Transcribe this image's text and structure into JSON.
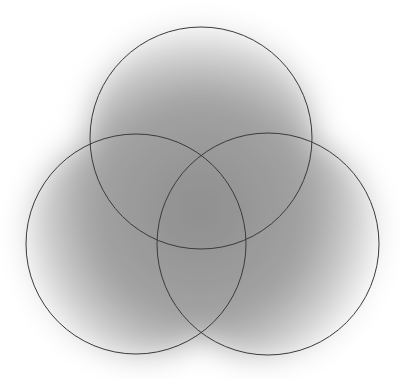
{
  "diagram": {
    "type": "venn",
    "set_count": 3,
    "labels": [],
    "colors": {
      "background": "#ffffff",
      "stroke": "#3a3a3a",
      "shade_center": "#8c8c8c",
      "shade_edge": "#ffffff"
    },
    "circles": [
      {
        "name": "top",
        "cx": 201,
        "cy": 138,
        "r": 111
      },
      {
        "name": "left",
        "cx": 136,
        "cy": 244,
        "r": 110
      },
      {
        "name": "right",
        "cx": 268,
        "cy": 244,
        "r": 111
      }
    ]
  }
}
